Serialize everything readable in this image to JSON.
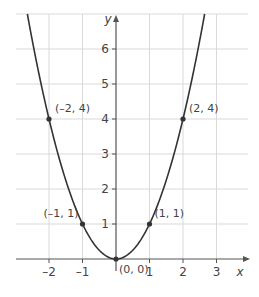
{
  "chart_data": {
    "type": "line",
    "title": "",
    "function": "y = x^2",
    "xlabel": "x",
    "ylabel": "y",
    "xlim": [
      -2.9,
      3.9
    ],
    "ylim": [
      0,
      7
    ],
    "grid": true,
    "x_ticks": [
      -2,
      -1,
      1,
      2,
      3
    ],
    "y_ticks": [
      1,
      2,
      3,
      4,
      5,
      6
    ],
    "x_tick_labels": [
      "–2",
      "–1",
      "1",
      "2",
      "3"
    ],
    "y_tick_labels": [
      "1",
      "2",
      "3",
      "4",
      "5",
      "6"
    ],
    "series": [
      {
        "name": "y = x²",
        "color": "#333333",
        "x": [
          -2.6,
          -2,
          -1,
          0,
          1,
          2,
          2.6
        ],
        "values": [
          6.76,
          4,
          1,
          0,
          1,
          4,
          6.76
        ]
      }
    ],
    "points": [
      {
        "x": -2,
        "y": 4,
        "label": "(–2, 4)"
      },
      {
        "x": -1,
        "y": 1,
        "label": "(–1, 1)"
      },
      {
        "x": 0,
        "y": 0,
        "label": "(0, 0)"
      },
      {
        "x": 1,
        "y": 1,
        "label": "(1, 1)"
      },
      {
        "x": 2,
        "y": 4,
        "label": "(2, 4)"
      }
    ]
  },
  "colors": {
    "grid": "#d9d9d9",
    "axis": "#555555",
    "curve": "#333333",
    "text": "#444444"
  },
  "labels": {
    "x_axis": "x",
    "y_axis": "y",
    "origin": "(0, 0)"
  }
}
